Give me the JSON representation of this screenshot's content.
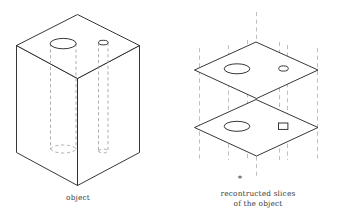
{
  "figure": {
    "type": "technical-line-diagram",
    "left_panel": {
      "caption": "object",
      "object_name": "rectangular-block",
      "features": [
        {
          "name": "large-hole",
          "shape": "circle",
          "section_shape": "ellipse"
        },
        {
          "name": "small-hole",
          "shape": "circle",
          "section_shape": "small-ellipse"
        }
      ]
    },
    "right_panel": {
      "caption_line1": "recontructed slices",
      "caption_line2": "of the object",
      "slices": [
        {
          "name": "upper-slice",
          "features": [
            {
              "name": "large-hole-section",
              "shape": "ellipse"
            },
            {
              "name": "small-hole-section",
              "shape": "ellipse"
            }
          ]
        },
        {
          "name": "lower-slice",
          "features": [
            {
              "name": "large-hole-section",
              "shape": "ellipse"
            },
            {
              "name": "small-hole-section",
              "shape": "rectangle"
            }
          ]
        }
      ]
    },
    "colors": {
      "line": "#231f20",
      "hidden_line": "#9a9a9a",
      "guide_line": "#b4b4b4",
      "caption": "#3a3a3a",
      "background": "#ffffff"
    }
  }
}
